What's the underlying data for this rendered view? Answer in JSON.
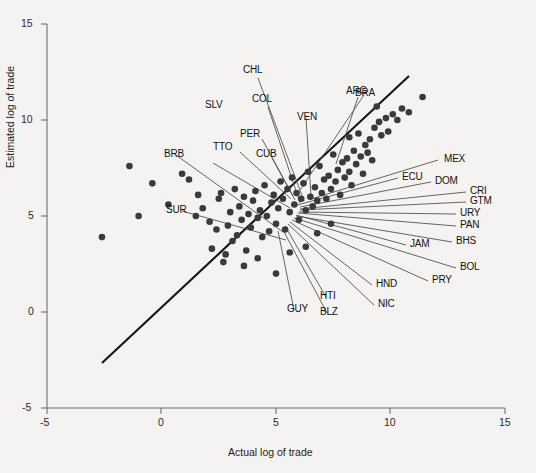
{
  "chart_data": {
    "type": "scatter",
    "title": "",
    "xlabel": "Actual log of trade",
    "ylabel": "Estimated log of trade",
    "xlim": [
      -5,
      15
    ],
    "ylim": [
      -5,
      15
    ],
    "xticks": [
      "-5",
      "0",
      "5",
      "10",
      "15"
    ],
    "yticks": [
      "-5",
      "0",
      "5",
      "10",
      "15"
    ],
    "grid": false,
    "legend": "none",
    "reference_line": {
      "name": "45-degree line",
      "from": [
        -2.6,
        -2.7
      ],
      "to": [
        11.4,
        11.5
      ]
    },
    "point_color": "#3a3a3a",
    "line_color": "#1a1a1a",
    "background_color": "#f4f3f1",
    "points": [
      [
        -2.6,
        3.9
      ],
      [
        -1.4,
        7.6
      ],
      [
        -1.0,
        5.0
      ],
      [
        -0.4,
        6.7
      ],
      [
        0.3,
        5.6
      ],
      [
        0.9,
        7.2
      ],
      [
        1.2,
        6.9
      ],
      [
        1.5,
        5.0
      ],
      [
        1.6,
        6.1
      ],
      [
        1.8,
        5.4
      ],
      [
        2.1,
        4.7
      ],
      [
        2.2,
        3.3
      ],
      [
        2.4,
        4.3
      ],
      [
        2.5,
        5.9
      ],
      [
        2.6,
        6.2
      ],
      [
        2.7,
        2.6
      ],
      [
        2.9,
        4.5
      ],
      [
        3.0,
        5.2
      ],
      [
        3.1,
        3.7
      ],
      [
        3.2,
        6.4
      ],
      [
        3.3,
        4.0
      ],
      [
        3.4,
        5.5
      ],
      [
        3.5,
        4.8
      ],
      [
        3.6,
        6.0
      ],
      [
        3.7,
        3.2
      ],
      [
        3.8,
        5.1
      ],
      [
        3.9,
        4.4
      ],
      [
        4.0,
        5.8
      ],
      [
        4.1,
        6.3
      ],
      [
        4.2,
        4.9
      ],
      [
        4.3,
        5.3
      ],
      [
        4.4,
        3.9
      ],
      [
        4.5,
        6.6
      ],
      [
        4.6,
        5.0
      ],
      [
        4.7,
        4.2
      ],
      [
        4.8,
        5.7
      ],
      [
        4.9,
        6.1
      ],
      [
        5.0,
        4.6
      ],
      [
        5.1,
        5.4
      ],
      [
        5.2,
        6.8
      ],
      [
        5.3,
        5.9
      ],
      [
        5.4,
        4.3
      ],
      [
        5.5,
        6.4
      ],
      [
        5.6,
        5.2
      ],
      [
        5.7,
        7.0
      ],
      [
        5.8,
        5.6
      ],
      [
        5.9,
        6.2
      ],
      [
        6.0,
        4.8
      ],
      [
        6.1,
        5.9
      ],
      [
        6.2,
        6.7
      ],
      [
        6.3,
        5.3
      ],
      [
        6.4,
        7.3
      ],
      [
        6.5,
        6.0
      ],
      [
        6.6,
        5.5
      ],
      [
        6.7,
        6.5
      ],
      [
        6.8,
        5.8
      ],
      [
        6.9,
        7.6
      ],
      [
        7.0,
        6.2
      ],
      [
        7.1,
        6.9
      ],
      [
        7.2,
        5.9
      ],
      [
        7.3,
        7.1
      ],
      [
        7.4,
        6.4
      ],
      [
        7.5,
        8.2
      ],
      [
        7.6,
        6.8
      ],
      [
        7.7,
        7.4
      ],
      [
        7.8,
        6.1
      ],
      [
        7.9,
        7.8
      ],
      [
        8.0,
        7.0
      ],
      [
        8.1,
        8.0
      ],
      [
        8.2,
        7.3
      ],
      [
        8.3,
        6.6
      ],
      [
        8.4,
        8.4
      ],
      [
        8.5,
        7.7
      ],
      [
        8.6,
        9.3
      ],
      [
        8.7,
        8.1
      ],
      [
        8.8,
        7.2
      ],
      [
        8.9,
        8.7
      ],
      [
        9.0,
        8.3
      ],
      [
        9.1,
        9.0
      ],
      [
        9.2,
        7.9
      ],
      [
        9.3,
        9.6
      ],
      [
        9.5,
        9.9
      ],
      [
        9.6,
        9.2
      ],
      [
        9.8,
        10.1
      ],
      [
        9.9,
        9.4
      ],
      [
        10.1,
        10.3
      ],
      [
        10.3,
        10.0
      ],
      [
        10.5,
        10.6
      ],
      [
        10.8,
        10.4
      ],
      [
        11.4,
        11.2
      ],
      [
        9.4,
        10.7
      ],
      [
        8.2,
        9.1
      ],
      [
        5.0,
        2.0
      ],
      [
        4.2,
        2.8
      ],
      [
        3.6,
        2.4
      ],
      [
        6.3,
        3.4
      ],
      [
        6.8,
        4.1
      ],
      [
        7.4,
        4.6
      ],
      [
        2.8,
        3.0
      ],
      [
        5.6,
        3.1
      ]
    ],
    "annotations": [
      {
        "code": "CHL"
      },
      {
        "code": "COL"
      },
      {
        "code": "SLV"
      },
      {
        "code": "PER"
      },
      {
        "code": "TTO"
      },
      {
        "code": "CUB"
      },
      {
        "code": "BRB"
      },
      {
        "code": "SUR"
      },
      {
        "code": "VEN"
      },
      {
        "code": "ARG"
      },
      {
        "code": "BRA"
      },
      {
        "code": "MEX"
      },
      {
        "code": "ECU"
      },
      {
        "code": "DOM"
      },
      {
        "code": "CRI"
      },
      {
        "code": "GTM"
      },
      {
        "code": "URY"
      },
      {
        "code": "PAN"
      },
      {
        "code": "JAM"
      },
      {
        "code": "BHS"
      },
      {
        "code": "BOL"
      },
      {
        "code": "PRY"
      },
      {
        "code": "HND"
      },
      {
        "code": "NIC"
      },
      {
        "code": "HTI"
      },
      {
        "code": "BLZ"
      },
      {
        "code": "GUY"
      }
    ]
  },
  "axes": {
    "x_title": "Actual log of trade",
    "y_title": "Estimated log of trade",
    "x_ticks": [
      {
        "label": "-5",
        "value": -5
      },
      {
        "label": "0",
        "value": 0
      },
      {
        "label": "5",
        "value": 5
      },
      {
        "label": "10",
        "value": 10
      },
      {
        "label": "15",
        "value": 15
      }
    ],
    "y_ticks": [
      {
        "label": "-5",
        "value": -5
      },
      {
        "label": "0",
        "value": 0
      },
      {
        "label": "5",
        "value": 5
      },
      {
        "label": "10",
        "value": 10
      },
      {
        "label": "15",
        "value": 15
      }
    ]
  },
  "labels": {
    "CHL": "CHL",
    "COL": "COL",
    "SLV": "SLV",
    "PER": "PER",
    "TTO": "TTO",
    "CUB": "CUB",
    "BRB": "BRB",
    "SUR": "SUR",
    "VEN": "VEN",
    "ARG": "ARG",
    "BRA": "BRA",
    "MEX": "MEX",
    "ECU": "ECU",
    "DOM": "DOM",
    "CRI": "CRI",
    "GTM": "GTM",
    "URY": "URY",
    "PAN": "PAN",
    "JAM": "JAM",
    "BHS": "BHS",
    "BOL": "BOL",
    "PRY": "PRY",
    "HND": "HND",
    "NIC": "NIC",
    "HTI": "HTI",
    "BLZ": "BLZ",
    "GUY": "GUY"
  }
}
